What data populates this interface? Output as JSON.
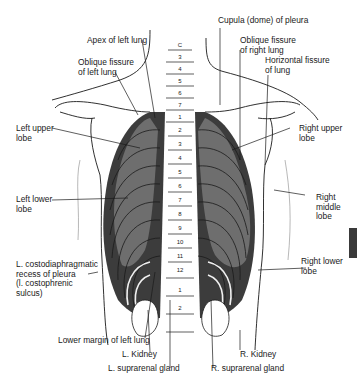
{
  "figure": {
    "colors": {
      "lung_fill": "#6e6e6e",
      "rib_dark": "#3c3c3c",
      "outline": "#1a1a1a",
      "background": "#ffffff",
      "side_tab": "#3a3a3a"
    },
    "vertebra_labels": {
      "cervical": [
        "C",
        "3",
        "4",
        "5",
        "6",
        "7"
      ],
      "thoracic": [
        "1",
        "2",
        "3",
        "4",
        "5",
        "6",
        "7",
        "8",
        "9",
        "10",
        "11",
        "12"
      ],
      "lumbar": [
        "1",
        "2"
      ]
    },
    "labels": {
      "apex_left_lung": "Apex of left lung",
      "cupula_pleura": "Cupula (dome) of pleura",
      "oblique_fissure_left": "Oblique fissure\nof left lung",
      "oblique_fissure_right": "Oblique fissure\nof right lung",
      "horizontal_fissure": "Horizontal fissure\nof lung",
      "left_upper_lobe": "Left upper\nlobe",
      "right_upper_lobe": "Right upper\nlobe",
      "left_lower_lobe": "Left lower\nlobe",
      "right_middle_lobe": "Right\nmiddle\nlobe",
      "right_lower_lobe": "Right lower\nlobe",
      "costodiaphragmatic_recess": "L. costodiaphragmatic\nrecess of pleura\n(l. costophrenic\nsulcus)",
      "lower_margin_left_lung": "Lower margin of left lung",
      "l_kidney": "L. Kidney",
      "l_suprarenal": "L. suprarenal gland",
      "r_kidney": "R. Kidney",
      "r_suprarenal": "R. suprarenal gland"
    }
  }
}
